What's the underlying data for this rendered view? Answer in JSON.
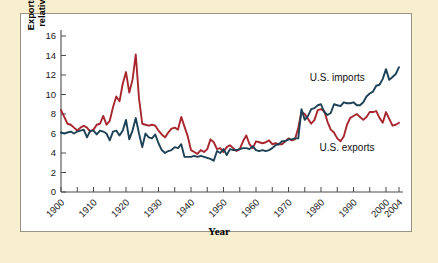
{
  "figure": {
    "background_color": "#f7efcf",
    "panel_color": "#ffffff",
    "panel_border_color": "#9a9384"
  },
  "chart_data": {
    "type": "line",
    "title": "",
    "xlabel": "Year",
    "ylabel": "Exports and imports\nrelative to GDP (%)",
    "xlim": [
      1900,
      2004
    ],
    "ylim": [
      0,
      16
    ],
    "ytick_values": [
      0,
      2,
      4,
      6,
      8,
      10,
      12,
      14,
      16
    ],
    "ytick_labels": [
      "0",
      "2",
      "4",
      "6",
      "8",
      "10",
      "12",
      "14",
      "16"
    ],
    "xtick_values": [
      1900,
      1905,
      1910,
      1915,
      1920,
      1925,
      1930,
      1935,
      1940,
      1945,
      1950,
      1955,
      1960,
      1965,
      1970,
      1975,
      1980,
      1985,
      1990,
      1995,
      2000,
      2004
    ],
    "xtick_labels": [
      "1900",
      "1910",
      "1920",
      "1930",
      "1940",
      "1950",
      "1960",
      "1970",
      "1980",
      "1990",
      "2000",
      "2004"
    ],
    "xtick_label_values": [
      1900,
      1910,
      1920,
      1930,
      1940,
      1950,
      1960,
      1970,
      1980,
      1990,
      2000,
      2004
    ],
    "xtick_label_rotation": -45,
    "grid": false,
    "legend_position": "inline-annotation",
    "annotations": [
      {
        "text": "U.S. imports",
        "x": 1985,
        "y": 11.4,
        "series": "U.S. imports"
      },
      {
        "text": "U.S. exports",
        "x": 1988,
        "y": 4.2,
        "series": "U.S. exports"
      }
    ],
    "x": [
      1900,
      1901,
      1902,
      1903,
      1904,
      1905,
      1906,
      1907,
      1908,
      1909,
      1910,
      1911,
      1912,
      1913,
      1914,
      1915,
      1916,
      1917,
      1918,
      1919,
      1920,
      1921,
      1922,
      1923,
      1924,
      1925,
      1926,
      1927,
      1928,
      1929,
      1930,
      1931,
      1932,
      1933,
      1934,
      1935,
      1936,
      1937,
      1938,
      1939,
      1940,
      1941,
      1942,
      1943,
      1944,
      1945,
      1946,
      1947,
      1948,
      1949,
      1950,
      1951,
      1952,
      1953,
      1954,
      1955,
      1956,
      1957,
      1958,
      1959,
      1960,
      1961,
      1962,
      1963,
      1964,
      1965,
      1966,
      1967,
      1968,
      1969,
      1970,
      1971,
      1972,
      1973,
      1974,
      1975,
      1976,
      1977,
      1978,
      1979,
      1980,
      1981,
      1982,
      1983,
      1984,
      1985,
      1986,
      1987,
      1988,
      1989,
      1990,
      1991,
      1992,
      1993,
      1994,
      1995,
      1996,
      1997,
      1998,
      1999,
      2000,
      2001,
      2002,
      2003,
      2004
    ],
    "series": [
      {
        "name": "U.S. exports",
        "color": "#a8272f",
        "values": [
          8.4,
          7.7,
          7.0,
          6.9,
          6.6,
          6.3,
          6.6,
          6.8,
          6.6,
          6.2,
          6.4,
          6.9,
          7.0,
          7.8,
          6.9,
          7.3,
          8.7,
          9.8,
          9.3,
          11.1,
          12.3,
          10.2,
          11.5,
          14.1,
          9.6,
          7.0,
          6.9,
          6.8,
          6.9,
          6.8,
          6.3,
          5.9,
          5.6,
          6.1,
          6.5,
          6.6,
          6.4,
          7.7,
          6.7,
          5.7,
          4.3,
          4.1,
          3.9,
          4.3,
          4.1,
          4.4,
          5.4,
          5.1,
          4.4,
          4.5,
          4.1,
          4.6,
          4.8,
          4.5,
          4.2,
          4.4,
          5.2,
          5.8,
          4.9,
          4.5,
          5.2,
          5.1,
          5.0,
          5.1,
          5.3,
          4.9,
          5.0,
          4.9,
          4.9,
          5.2,
          5.5,
          5.3,
          5.4,
          6.6,
          8.2,
          8.0,
          7.5,
          7.0,
          7.4,
          8.4,
          8.5,
          8.3,
          7.2,
          6.4,
          6.1,
          5.5,
          5.2,
          5.7,
          6.9,
          7.6,
          7.8,
          8.0,
          7.7,
          7.4,
          7.7,
          8.2,
          8.2,
          8.3,
          7.6,
          7.1,
          8.2,
          7.5,
          6.8,
          6.9,
          7.1
        ]
      },
      {
        "name": "U.S. imports",
        "color": "#1d4256",
        "values": [
          6.1,
          6.0,
          6.1,
          6.2,
          6.0,
          6.2,
          6.3,
          6.4,
          5.6,
          6.3,
          6.3,
          5.9,
          6.3,
          6.2,
          6.0,
          5.3,
          6.2,
          6.3,
          5.8,
          6.3,
          7.4,
          5.4,
          6.3,
          7.6,
          6.0,
          4.6,
          6.0,
          5.6,
          5.5,
          5.9,
          5.0,
          4.3,
          4.0,
          4.2,
          4.3,
          4.6,
          4.5,
          4.9,
          3.6,
          3.6,
          3.6,
          3.7,
          3.6,
          3.7,
          3.6,
          3.5,
          3.4,
          3.2,
          4.2,
          4.0,
          4.4,
          3.8,
          4.4,
          4.3,
          4.3,
          4.4,
          4.5,
          4.5,
          4.4,
          4.7,
          4.3,
          4.2,
          4.3,
          4.2,
          4.3,
          4.5,
          4.8,
          4.9,
          5.2,
          5.2,
          5.4,
          5.4,
          5.5,
          5.5,
          8.5,
          7.4,
          7.8,
          8.5,
          8.6,
          8.9,
          9.0,
          8.2,
          7.9,
          8.1,
          9.0,
          8.9,
          8.8,
          9.2,
          9.1,
          9.1,
          9.2,
          8.9,
          8.9,
          9.2,
          9.8,
          10.1,
          10.3,
          10.9,
          11.0,
          11.6,
          12.6,
          11.5,
          11.8,
          12.1,
          12.8
        ]
      }
    ]
  }
}
